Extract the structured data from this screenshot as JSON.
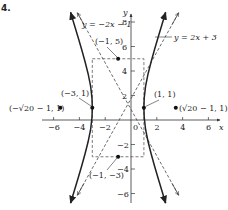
{
  "figure": {
    "number_label": "4.",
    "axes": {
      "x_label": "x",
      "y_label": "y",
      "x_ticks": [
        {
          "value": -6,
          "label": "−6"
        },
        {
          "value": -4,
          "label": "−4"
        },
        {
          "value": -2,
          "label": "−2"
        },
        {
          "value": 2,
          "label": "2"
        },
        {
          "value": 4,
          "label": "4"
        },
        {
          "value": 6,
          "label": "6"
        }
      ],
      "y_ticks": [
        {
          "value": 8,
          "label": "8"
        },
        {
          "value": 6,
          "label": "6"
        },
        {
          "value": 4,
          "label": "4"
        },
        {
          "value": 2,
          "label": "2"
        },
        {
          "value": -2,
          "label": "−2"
        },
        {
          "value": -4,
          "label": "−4"
        },
        {
          "value": -6,
          "label": "−6"
        }
      ],
      "origin_label": "0",
      "x_range": [
        -7,
        7
      ],
      "y_range": [
        -7,
        9
      ]
    },
    "asymptotes": [
      {
        "label": "y = −2x − 1",
        "slope": -2,
        "intercept": -1
      },
      {
        "label": "y = 2x + 3",
        "slope": 2,
        "intercept": 3
      }
    ],
    "hyperbola": {
      "equation": "(x+1)^2/4 - (y-1)^2/16 = 1",
      "center": [
        -1,
        1
      ],
      "a": 2,
      "b": 4
    },
    "points": [
      {
        "label": "(−1, 5)",
        "x": -1,
        "y": 5
      },
      {
        "label": "(−3, 1)",
        "x": -3,
        "y": 1
      },
      {
        "label": "(1, 1)",
        "x": 1,
        "y": 1
      },
      {
        "label": "(−1, −3)",
        "x": -1,
        "y": -3
      },
      {
        "label": "(−√20 − 1, 1)",
        "x": -5.47,
        "y": 1
      },
      {
        "label": "(√20 − 1, 1)",
        "x": 3.47,
        "y": 1
      }
    ],
    "colors": {
      "curve": "#222222",
      "dashed": "#444444",
      "axis": "#333333"
    }
  }
}
